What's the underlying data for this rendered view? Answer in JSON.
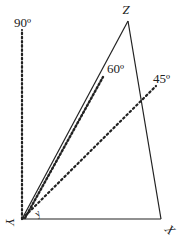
{
  "diagram": {
    "vertices": {
      "Y": {
        "label": "Y",
        "x": 22,
        "y": 219
      },
      "X": {
        "label": "X",
        "x": 161,
        "y": 219
      },
      "Z": {
        "label": "Z",
        "x": 128,
        "y": 21
      }
    },
    "reference_lines": [
      {
        "name": "90-degree-line",
        "label": "90º",
        "angle_deg": 90
      },
      {
        "name": "60-degree-line",
        "label": "60º",
        "angle_deg": 60
      },
      {
        "name": "45-degree-line",
        "label": "45º",
        "angle_deg": 45
      }
    ],
    "angle_mark_label": "y"
  }
}
